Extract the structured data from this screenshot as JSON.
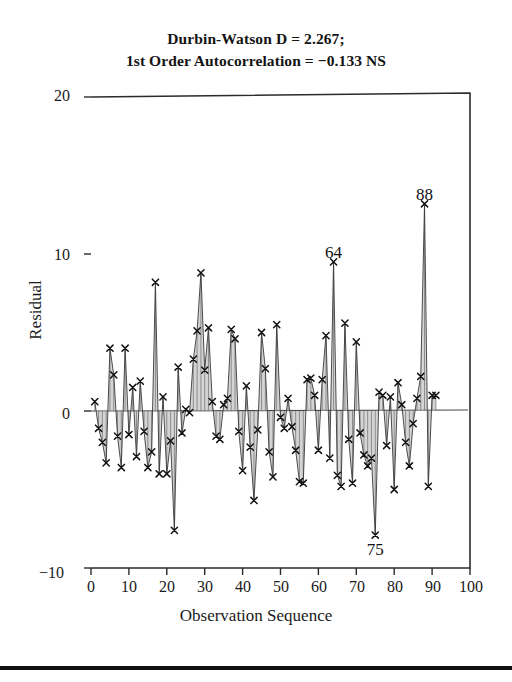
{
  "figure": {
    "title_lines": [
      "Durbin-Watson D = 2.267;",
      "1st Order Autocorrelation = −0.133 NS"
    ],
    "ylabel": "Residual",
    "xlabel": "Observation Sequence"
  },
  "chart_data": {
    "type": "line",
    "title": "Durbin-Watson D = 2.267; 1st Order Autocorrelation = −0.133 NS",
    "subtitle": "",
    "xlabel": "Observation Sequence",
    "ylabel": "Residual",
    "xlim": [
      0,
      100
    ],
    "ylim": [
      -10,
      20
    ],
    "xticks": [
      0,
      10,
      20,
      30,
      40,
      50,
      60,
      70,
      80,
      90,
      100
    ],
    "yticks": [
      -10,
      0,
      10,
      20
    ],
    "grid": false,
    "legend": null,
    "marker": "x",
    "fill_to_zero": true,
    "fill_color": "#b0b0b0",
    "line_color": "#3a3a3a",
    "zero_line": 0,
    "annotations": [
      {
        "label": "64",
        "x": 64,
        "y": 9.5
      },
      {
        "label": "88",
        "x": 88,
        "y": 13.2
      },
      {
        "label": "75",
        "x": 75,
        "y": -7.9
      }
    ],
    "x": [
      1,
      2,
      3,
      4,
      5,
      6,
      7,
      8,
      9,
      10,
      11,
      12,
      13,
      14,
      15,
      16,
      17,
      18,
      19,
      20,
      21,
      22,
      23,
      24,
      25,
      26,
      27,
      28,
      29,
      30,
      31,
      32,
      33,
      34,
      35,
      36,
      37,
      38,
      39,
      40,
      41,
      42,
      43,
      44,
      45,
      46,
      47,
      48,
      49,
      50,
      51,
      52,
      53,
      54,
      55,
      56,
      57,
      58,
      59,
      60,
      61,
      62,
      63,
      64,
      65,
      66,
      67,
      68,
      69,
      70,
      71,
      72,
      73,
      74,
      75,
      76,
      77,
      78,
      79,
      80,
      81,
      82,
      83,
      84,
      85,
      86,
      87,
      88,
      89,
      90,
      91
    ],
    "values": [
      0.6,
      -1.1,
      -2.0,
      -3.3,
      4.0,
      2.3,
      -1.6,
      -3.6,
      4.0,
      -1.5,
      1.5,
      -2.9,
      1.9,
      -1.3,
      -3.6,
      -2.6,
      8.2,
      -4.0,
      0.9,
      -4.0,
      -1.9,
      -7.6,
      2.8,
      -1.4,
      0.1,
      -0.1,
      3.3,
      5.1,
      8.8,
      2.6,
      5.3,
      0.6,
      -1.6,
      -1.8,
      0.4,
      0.8,
      5.2,
      4.6,
      -1.3,
      -3.8,
      1.6,
      -2.3,
      -5.7,
      -1.2,
      5.0,
      2.7,
      -2.6,
      -4.2,
      5.5,
      -0.4,
      -1.1,
      0.8,
      -1.0,
      -2.5,
      -4.5,
      -4.6,
      2.0,
      2.1,
      1.0,
      -2.5,
      2.0,
      4.8,
      -3.0,
      9.5,
      -4.1,
      -4.8,
      5.6,
      -1.8,
      -4.6,
      4.4,
      -1.4,
      -2.8,
      -3.5,
      -3.0,
      -7.9,
      1.2,
      1.0,
      -2.2,
      0.9,
      -5.0,
      1.8,
      0.4,
      -2.0,
      -3.5,
      -0.8,
      0.8,
      2.2,
      13.2,
      -4.8,
      1.0,
      1.0
    ],
    "series": [
      {
        "name": "Residual",
        "values": [
          0.6,
          -1.1,
          -2.0,
          -3.3,
          4.0,
          2.3,
          -1.6,
          -3.6,
          4.0,
          -1.5,
          1.5,
          -2.9,
          1.9,
          -1.3,
          -3.6,
          -2.6,
          8.2,
          -4.0,
          0.9,
          -4.0,
          -1.9,
          -7.6,
          2.8,
          -1.4,
          0.1,
          -0.1,
          3.3,
          5.1,
          8.8,
          2.6,
          5.3,
          0.6,
          -1.6,
          -1.8,
          0.4,
          0.8,
          5.2,
          4.6,
          -1.3,
          -3.8,
          1.6,
          -2.3,
          -5.7,
          -1.2,
          5.0,
          2.7,
          -2.6,
          -4.2,
          5.5,
          -0.4,
          -1.1,
          0.8,
          -1.0,
          -2.5,
          -4.5,
          -4.6,
          2.0,
          2.1,
          1.0,
          -2.5,
          2.0,
          4.8,
          -3.0,
          9.5,
          -4.1,
          -4.8,
          5.6,
          -1.8,
          -4.6,
          4.4,
          -1.4,
          -2.8,
          -3.5,
          -3.0,
          -7.9,
          1.2,
          1.0,
          -2.2,
          0.9,
          -5.0,
          1.8,
          0.4,
          -2.0,
          -3.5,
          -0.8,
          0.8,
          2.2,
          13.2,
          -4.8,
          1.0,
          1.0
        ]
      }
    ]
  },
  "axis_text": {
    "yticks": [
      "20",
      "10",
      "0",
      "−10"
    ],
    "xticks": [
      "0",
      "10",
      "20",
      "30",
      "40",
      "50",
      "60",
      "70",
      "80",
      "90",
      "100"
    ]
  }
}
